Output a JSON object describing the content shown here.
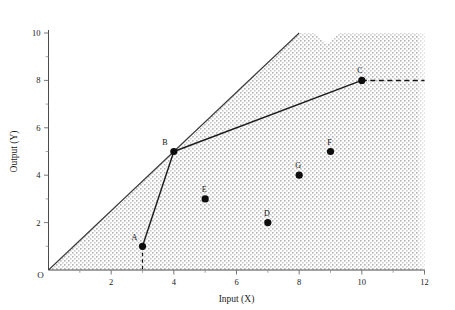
{
  "chart_data": {
    "type": "scatter",
    "title": "",
    "xlabel": "Input (X)",
    "ylabel": "Output (Y)",
    "xlim": [
      0,
      12
    ],
    "ylim": [
      0,
      10
    ],
    "xticks": [
      0,
      2,
      4,
      6,
      8,
      10,
      12
    ],
    "xtick_labels": [
      "0",
      "2",
      "4",
      "6",
      "8",
      "10",
      "12"
    ],
    "yticks": [
      0,
      2,
      4,
      6,
      8,
      10
    ],
    "ytick_labels": [
      "0",
      "2",
      "4",
      "6",
      "8",
      "10"
    ],
    "x_minor_ticks": [
      1,
      3,
      5,
      7,
      9,
      11
    ],
    "y_minor_ticks": [
      1,
      3,
      5,
      7,
      9
    ],
    "grid": false,
    "legend": false,
    "origin_label": "O",
    "points": [
      {
        "label": "A",
        "x": 3,
        "y": 1,
        "label_dx": -8,
        "label_dy": -6
      },
      {
        "label": "B",
        "x": 4,
        "y": 5,
        "label_dx": -9,
        "label_dy": -7
      },
      {
        "label": "C",
        "x": 10,
        "y": 8,
        "label_dx": -2,
        "label_dy": -7
      },
      {
        "label": "D",
        "x": 7,
        "y": 2,
        "label_dx": -1,
        "label_dy": -7
      },
      {
        "label": "E",
        "x": 5,
        "y": 3,
        "label_dx": -1,
        "label_dy": -7
      },
      {
        "label": "F",
        "x": 9,
        "y": 5,
        "label_dx": -1,
        "label_dy": -7
      },
      {
        "label": "G",
        "x": 8,
        "y": 4,
        "label_dx": -1,
        "label_dy": -7
      }
    ],
    "frontier_path": [
      {
        "x": 3,
        "y": 1
      },
      {
        "x": 4,
        "y": 5
      },
      {
        "x": 10,
        "y": 8
      }
    ],
    "ray_from_origin": [
      {
        "x": 0,
        "y": 0
      },
      {
        "x": 8,
        "y": 10
      }
    ],
    "dashed_segments": [
      {
        "name": "vertical-from-A",
        "x1": 3,
        "y1": 1,
        "x2": 3,
        "y2": 0
      },
      {
        "name": "horizontal-from-C",
        "x1": 10,
        "y1": 8,
        "x2": 12,
        "y2": 8
      }
    ],
    "shaded_region": {
      "name": "production-possibility-set",
      "fill": "#e3e3e3",
      "vertices": [
        {
          "x": 0,
          "y": 0
        },
        {
          "x": 8,
          "y": 10
        },
        {
          "x": 12,
          "y": 10
        },
        {
          "x": 12,
          "y": 0
        }
      ]
    }
  },
  "colors": {
    "axis": "#4a4a4a",
    "frontier": "#1a1a1a",
    "point": "#0d0d0d",
    "shade": "#e3e3e3",
    "background": "#ffffff"
  }
}
